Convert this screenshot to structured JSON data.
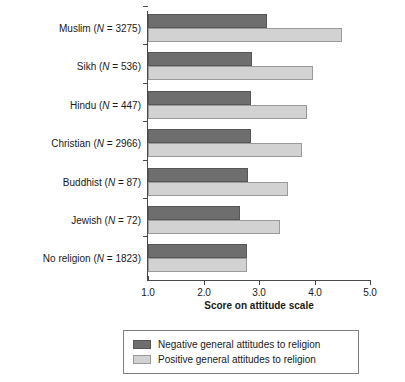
{
  "chart_data": {
    "type": "bar",
    "orientation": "horizontal",
    "title": "",
    "xlabel": "Score on attitude scale",
    "ylabel": "",
    "xlim": [
      1.0,
      5.0
    ],
    "xticks": [
      "1.0",
      "2.0",
      "3.0",
      "4.0",
      "5.0"
    ],
    "xtick_values": [
      1.0,
      2.0,
      3.0,
      4.0,
      5.0
    ],
    "grid": false,
    "legend_position": "bottom",
    "categories": [
      "Muslim (N = 3275)",
      "Sikh (N = 536)",
      "Hindu (N = 447)",
      "Christian (N = 2966)",
      "Buddhist (N = 87)",
      "Jewish (N = 72)",
      "No religion (N = 1823)"
    ],
    "category_parts": [
      {
        "name": "Muslim",
        "n_label": "(N = 3275)",
        "n": 3275
      },
      {
        "name": "Sikh",
        "n_label": "(N = 536)",
        "n": 536
      },
      {
        "name": "Hindu",
        "n_label": "(N = 447)",
        "n": 447
      },
      {
        "name": "Christian",
        "n_label": "(N = 2966)",
        "n": 2966
      },
      {
        "name": "Buddhist",
        "n_label": "(N = 87)",
        "n": 87
      },
      {
        "name": "Jewish",
        "n_label": "(N = 72)",
        "n": 72
      },
      {
        "name": "No religion",
        "n_label": "(N = 1823)",
        "n": 1823
      }
    ],
    "series": [
      {
        "name": "Negative general attitudes to religion",
        "color": "#6e6e6e",
        "values": [
          3.15,
          2.88,
          2.85,
          2.86,
          2.8,
          2.65,
          2.79
        ]
      },
      {
        "name": "Positive general attitudes to religion",
        "color": "#d2d2d2",
        "values": [
          4.5,
          3.97,
          3.86,
          3.78,
          3.52,
          3.38,
          2.78
        ]
      }
    ]
  },
  "legend": {
    "entries": [
      {
        "label": "Negative general attitudes to religion",
        "swatch": "dark-gray-swatch"
      },
      {
        "label": "Positive general attitudes to religion",
        "swatch": "light-gray-swatch"
      }
    ]
  },
  "axis": {
    "x_title": "Score on attitude scale"
  }
}
